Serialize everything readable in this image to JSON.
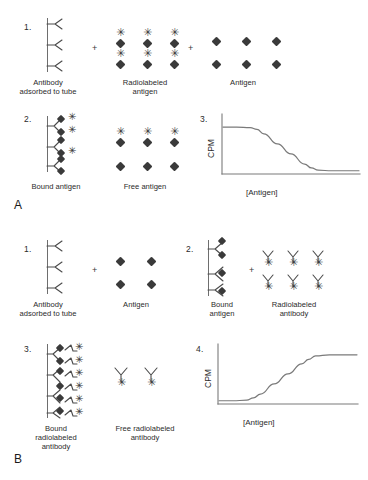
{
  "figure": {
    "panels": [
      {
        "letter": "A",
        "name": "competitive-radioimmunoassay",
        "steps": [
          {
            "number": "1.",
            "items": [
              {
                "label_line1": "Antibody",
                "label_line2": "adsorbed to tube"
              },
              {
                "label_line1": "Radiolabeled",
                "label_line2": "antigen"
              },
              {
                "label_line1": "Antigen",
                "label_line2": ""
              }
            ],
            "operators": [
              "+",
              "+"
            ]
          },
          {
            "number": "2.",
            "items": [
              {
                "label_line1": "Bound antigen",
                "label_line2": ""
              },
              {
                "label_line1": "Free antigen",
                "label_line2": ""
              }
            ],
            "operators": []
          },
          {
            "number": "3.",
            "items": [],
            "operators": []
          }
        ]
      },
      {
        "letter": "B",
        "name": "sandwich-immunoradiometric-assay",
        "steps": [
          {
            "number": "1.",
            "items": [
              {
                "label_line1": "Antibody",
                "label_line2": "adsorbed to tube"
              },
              {
                "label_line1": "Antigen",
                "label_line2": ""
              }
            ],
            "operators": [
              "+"
            ]
          },
          {
            "number": "2.",
            "items": [
              {
                "label_line1": "Bound",
                "label_line2": "antigen"
              },
              {
                "label_line1": "Radiolabeled",
                "label_line2": "antibody"
              }
            ],
            "operators": [
              "+"
            ]
          },
          {
            "number": "3.",
            "items": [
              {
                "label_line1": "Bound",
                "label_line2": "radiolabeled",
                "label_line3": "antibody"
              },
              {
                "label_line1": "Free radiolabeled",
                "label_line2": "antibody"
              }
            ],
            "operators": []
          },
          {
            "number": "4.",
            "items": [],
            "operators": []
          }
        ]
      }
    ]
  },
  "chart_data": [
    {
      "type": "line",
      "name": "competitive-ria-curve",
      "title": "3.",
      "xlabel": "[Antigen]",
      "ylabel": "CPM",
      "grid": false,
      "legend": null,
      "xlim": [
        0,
        100
      ],
      "ylim": [
        0,
        100
      ],
      "shape": "decreasing-sigmoid",
      "x": [
        0,
        10,
        20,
        25,
        30,
        40,
        50,
        60,
        65,
        70,
        80,
        90,
        100
      ],
      "y": [
        82,
        82,
        81,
        78,
        70,
        52,
        34,
        16,
        9,
        5,
        4,
        4,
        4
      ]
    },
    {
      "type": "line",
      "name": "irma-curve",
      "title": "4.",
      "xlabel": "[Antigen]",
      "ylabel": "CPM",
      "grid": false,
      "legend": null,
      "xlim": [
        0,
        100
      ],
      "ylim": [
        0,
        100
      ],
      "shape": "increasing-sigmoid",
      "x": [
        0,
        10,
        20,
        25,
        30,
        40,
        50,
        60,
        65,
        70,
        80,
        90,
        100
      ],
      "y": [
        4,
        4,
        5,
        9,
        16,
        34,
        52,
        70,
        78,
        84,
        86,
        86,
        86
      ]
    }
  ],
  "colors": {
    "ink": "#3a3a3a",
    "line": "#6e6e6e",
    "text": "#2b2b2b",
    "background": "#ffffff"
  },
  "icons": {
    "antibody": "antibody-y-icon",
    "antigen": "antigen-diamond-icon",
    "radiolabel": "radiolabel-star-icon"
  },
  "glyphs": {
    "star": "✳"
  }
}
